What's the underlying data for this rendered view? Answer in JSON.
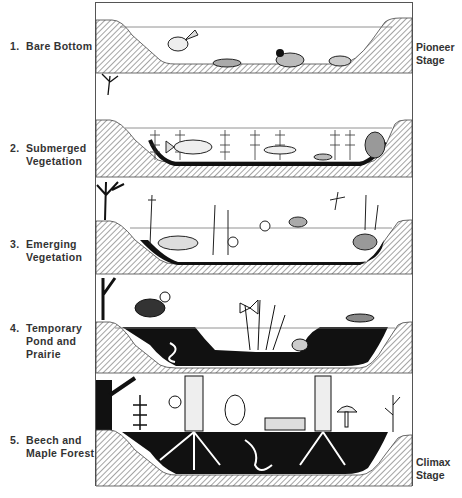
{
  "figure": {
    "stages": [
      {
        "number": "1.",
        "line1": "Bare Bottom",
        "line2": "",
        "line3": "",
        "organisms": [
          "fish",
          "dragonfly nymph",
          "caddisfly larva",
          "mussel"
        ]
      },
      {
        "number": "2.",
        "line1": "Submerged",
        "line2": "Vegetation",
        "line3": "",
        "organisms": [
          "fish",
          "water plants",
          "turtle",
          "snail"
        ]
      },
      {
        "number": "3.",
        "line1": "Emerging",
        "line2": "Vegetation",
        "line3": "",
        "organisms": [
          "fish",
          "cattails",
          "frog",
          "dragonfly",
          "snail",
          "turtle",
          "water lily"
        ]
      },
      {
        "number": "4.",
        "line1": "Temporary",
        "line2": "Pond and",
        "line3": "Prairie",
        "organisms": [
          "meadowlark",
          "butterfly",
          "grasshopper",
          "worm",
          "toad",
          "grasses"
        ]
      },
      {
        "number": "5.",
        "line1": "Beech and",
        "line2": "Maple Forest",
        "line3": "",
        "organisms": [
          "trees",
          "fern",
          "squirrel",
          "worm",
          "mushroom",
          "snail",
          "log"
        ]
      }
    ],
    "side_labels": {
      "pioneer": {
        "line1": "Pioneer",
        "line2": "Stage"
      },
      "climax": {
        "line1": "Climax",
        "line2": "Stage"
      }
    }
  }
}
